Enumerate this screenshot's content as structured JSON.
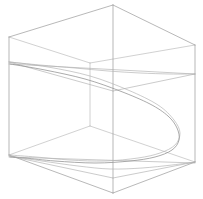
{
  "figure": {
    "title": "",
    "background_color": "#ffffff",
    "width": 203,
    "height": 199,
    "line_color": "#9a9a9a",
    "hidden_line_color": "#b8b8b8",
    "curve_color": "#8f8f8f",
    "stroke_width": "0.7"
  },
  "chart_data": {
    "type": "line",
    "title": "",
    "subtitle": "",
    "xlabel": "",
    "ylabel": "",
    "zlabel": "",
    "projection": "3d-wireframe",
    "grid": false,
    "legend": null,
    "axis_ticks": [],
    "tick_labels": [],
    "annotations": [],
    "bounding_box": {
      "name": "cube-frame",
      "vertices": {
        "front_bottom": [
          113,
          193
        ],
        "front_top": [
          113,
          5
        ],
        "left_bottom": [
          9,
          155
        ],
        "left_top": [
          9,
          37
        ],
        "right_bottom": [
          195,
          162
        ],
        "right_top": [
          195,
          45
        ],
        "back_bottom": [
          90,
          126
        ],
        "back_top": [
          90,
          63
        ]
      },
      "edges": [
        [
          "left_top",
          "front_top"
        ],
        [
          "front_top",
          "right_top"
        ],
        [
          "left_top",
          "back_top"
        ],
        [
          "back_top",
          "right_top"
        ],
        [
          "left_bottom",
          "front_bottom"
        ],
        [
          "front_bottom",
          "right_bottom"
        ],
        [
          "left_bottom",
          "back_bottom"
        ],
        [
          "back_bottom",
          "right_bottom"
        ],
        [
          "left_top",
          "left_bottom"
        ],
        [
          "front_top",
          "front_bottom"
        ],
        [
          "right_top",
          "right_bottom"
        ],
        [
          "back_top",
          "back_bottom"
        ]
      ]
    },
    "curves": [
      {
        "name": "upper-parabola-front",
        "points": [
          [
            10,
            64
          ],
          [
            45,
            70
          ],
          [
            85,
            79
          ],
          [
            120,
            91
          ],
          [
            150,
            104
          ],
          [
            168,
            116
          ],
          [
            177,
            128
          ],
          [
            179,
            140
          ],
          [
            172,
            150
          ],
          [
            155,
            157
          ],
          [
            130,
            161
          ],
          [
            95,
            163
          ],
          [
            55,
            161
          ],
          [
            25,
            158
          ],
          [
            10,
            157
          ]
        ],
        "emphasis": "primary"
      },
      {
        "name": "upper-parabola-back",
        "points": [
          [
            10,
            62
          ],
          [
            48,
            67
          ],
          [
            90,
            76
          ],
          [
            128,
            90
          ],
          [
            158,
            105
          ],
          [
            174,
            120
          ],
          [
            180,
            133
          ],
          [
            175,
            145
          ],
          [
            160,
            153
          ],
          [
            138,
            158
          ],
          [
            105,
            161
          ],
          [
            70,
            160
          ],
          [
            36,
            157
          ],
          [
            10,
            155
          ]
        ],
        "emphasis": "secondary"
      },
      {
        "name": "top-face-trace",
        "points": [
          [
            9,
            62
          ],
          [
            40,
            65
          ],
          [
            75,
            68
          ],
          [
            108,
            71
          ],
          [
            140,
            73
          ],
          [
            170,
            74
          ],
          [
            195,
            74
          ]
        ],
        "emphasis": "secondary"
      },
      {
        "name": "bottom-face-trace",
        "points": [
          [
            9,
            156
          ],
          [
            42,
            161
          ],
          [
            78,
            166
          ],
          [
            110,
            169
          ],
          [
            142,
            168
          ],
          [
            172,
            165
          ],
          [
            195,
            162
          ]
        ],
        "emphasis": "secondary"
      }
    ],
    "series": [
      {
        "name": "saddle-surface-isoline-upper",
        "values": [
          64,
          70,
          79,
          91,
          104,
          116,
          128,
          140,
          150,
          157,
          161,
          163,
          161,
          158,
          157
        ]
      },
      {
        "name": "saddle-surface-isoline-lower",
        "values": [
          62,
          67,
          76,
          90,
          105,
          120,
          133,
          145,
          153,
          158,
          161,
          160,
          157,
          155
        ]
      }
    ],
    "xlim": [
      9,
      195
    ],
    "ylim": [
      5,
      193
    ]
  },
  "accessibility": {
    "alt_text": "Wireframe 3D box plot with curved saddle surface"
  }
}
